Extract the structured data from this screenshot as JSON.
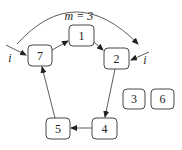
{
  "diagram": {
    "nodes": [
      {
        "id": "7",
        "label": "7",
        "in_cycle": true
      },
      {
        "id": "1",
        "label": "1",
        "in_cycle": true
      },
      {
        "id": "2",
        "label": "2",
        "in_cycle": true
      },
      {
        "id": "4",
        "label": "4",
        "in_cycle": true
      },
      {
        "id": "5",
        "label": "5",
        "in_cycle": true
      },
      {
        "id": "3",
        "label": "3",
        "in_cycle": false
      },
      {
        "id": "6",
        "label": "6",
        "in_cycle": false
      }
    ],
    "edges": [
      {
        "from": "7",
        "to": "1"
      },
      {
        "from": "1",
        "to": "2"
      },
      {
        "from": "2",
        "to": "4"
      },
      {
        "from": "4",
        "to": "5"
      },
      {
        "from": "5",
        "to": "7"
      }
    ],
    "skip_arc": {
      "from": "7",
      "to": "2",
      "label": "m = 3"
    },
    "pointers": [
      {
        "label": "i",
        "target": "7"
      },
      {
        "label": "i",
        "target": "2"
      }
    ]
  }
}
